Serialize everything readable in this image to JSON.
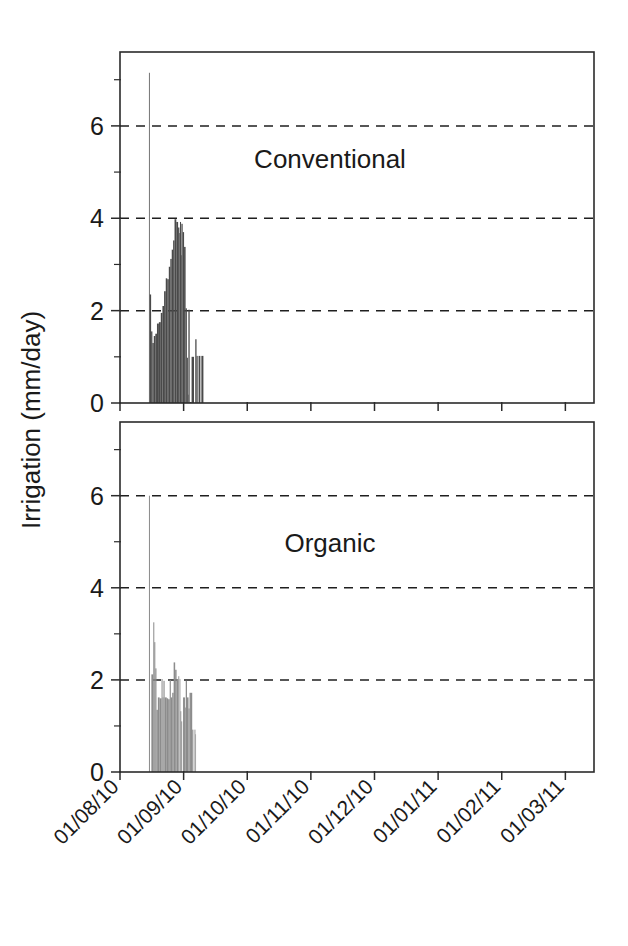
{
  "figure": {
    "ylabel": "Irrigation (mm/day)",
    "background": "#ffffff",
    "axis_color": "#2b2b2b"
  },
  "chart_data": {
    "type": "bar",
    "title": "",
    "xlabel": "",
    "ylabel": "Irrigation (mm/day)",
    "ylim": [
      0,
      7.6
    ],
    "yticks": [
      0,
      2,
      4,
      6
    ],
    "yticks_minor": [
      1,
      3,
      5,
      7
    ],
    "gridlines_y": [
      2,
      4,
      6
    ],
    "grid": "dashed horizontal only",
    "legend": "none",
    "xlim": [
      "01/08/10",
      "15/03/11"
    ],
    "xtick_labels": [
      "01/08/10",
      "01/09/10",
      "01/10/10",
      "01/11/10",
      "01/12/10",
      "01/01/11",
      "01/02/11",
      "01/03/11"
    ],
    "xtick_rotation": -45,
    "panels": [
      {
        "name": "Conventional",
        "annotation": "Conventional",
        "bar_color": "#4a4a4a",
        "series_name": "Conventional irrigation",
        "bars": [
          {
            "x": 0.455,
            "w": 0.012,
            "v": 7.15
          },
          {
            "x": 0.467,
            "w": 0.022,
            "v": 2.35
          },
          {
            "x": 0.489,
            "w": 0.02,
            "v": 1.55
          },
          {
            "x": 0.509,
            "w": 0.022,
            "v": 1.3
          },
          {
            "x": 0.531,
            "w": 0.024,
            "v": 1.45
          },
          {
            "x": 0.555,
            "w": 0.026,
            "v": 1.5
          },
          {
            "x": 0.581,
            "w": 0.03,
            "v": 1.72
          },
          {
            "x": 0.611,
            "w": 0.03,
            "v": 1.75
          },
          {
            "x": 0.641,
            "w": 0.026,
            "v": 1.95
          },
          {
            "x": 0.667,
            "w": 0.026,
            "v": 2.1
          },
          {
            "x": 0.693,
            "w": 0.026,
            "v": 2.42
          },
          {
            "x": 0.719,
            "w": 0.024,
            "v": 2.7
          },
          {
            "x": 0.743,
            "w": 0.024,
            "v": 2.68
          },
          {
            "x": 0.767,
            "w": 0.024,
            "v": 2.95
          },
          {
            "x": 0.791,
            "w": 0.022,
            "v": 3.12
          },
          {
            "x": 0.813,
            "w": 0.022,
            "v": 3.32
          },
          {
            "x": 0.835,
            "w": 0.022,
            "v": 3.52
          },
          {
            "x": 0.857,
            "w": 0.028,
            "v": 3.98
          },
          {
            "x": 0.885,
            "w": 0.028,
            "v": 3.92
          },
          {
            "x": 0.913,
            "w": 0.02,
            "v": 3.8
          },
          {
            "x": 0.933,
            "w": 0.01,
            "v": 3.68
          },
          {
            "x": 0.943,
            "w": 0.016,
            "v": 3.92
          },
          {
            "x": 0.959,
            "w": 0.006,
            "v": 3.2
          },
          {
            "x": 0.965,
            "w": 0.02,
            "v": 3.88
          },
          {
            "x": 0.985,
            "w": 0.022,
            "v": 3.7
          },
          {
            "x": 1.007,
            "w": 0.024,
            "v": 3.38
          },
          {
            "x": 1.031,
            "w": 0.02,
            "v": 2.05
          },
          {
            "x": 1.051,
            "w": 0.016,
            "v": 0.98
          },
          {
            "x": 1.067,
            "w": 0.008,
            "v": 0.18
          },
          {
            "x": 1.075,
            "w": 0.02,
            "v": 2.02
          },
          {
            "x": 1.095,
            "w": 0.03,
            "v": 0.02
          },
          {
            "x": 1.125,
            "w": 0.038,
            "v": 1.0
          },
          {
            "x": 1.163,
            "w": 0.02,
            "v": 0.0
          },
          {
            "x": 1.183,
            "w": 0.02,
            "v": 1.38
          },
          {
            "x": 1.203,
            "w": 0.018,
            "v": 1.02
          },
          {
            "x": 1.221,
            "w": 0.014,
            "v": 0.0
          },
          {
            "x": 1.235,
            "w": 0.028,
            "v": 1.02
          },
          {
            "x": 1.263,
            "w": 0.016,
            "v": 0.0
          },
          {
            "x": 1.279,
            "w": 0.032,
            "v": 1.02
          }
        ]
      },
      {
        "name": "Organic",
        "annotation": "Organic",
        "bar_color": "#8c8c8c",
        "series_name": "Organic irrigation",
        "bars": [
          {
            "x": 0.455,
            "w": 0.016,
            "v": 6.0
          },
          {
            "x": 0.471,
            "w": 0.022,
            "v": 0.0
          },
          {
            "x": 0.493,
            "w": 0.03,
            "v": 2.12
          },
          {
            "x": 0.523,
            "w": 0.016,
            "v": 3.25
          },
          {
            "x": 0.539,
            "w": 0.016,
            "v": 2.82
          },
          {
            "x": 0.555,
            "w": 0.018,
            "v": 2.25
          },
          {
            "x": 0.573,
            "w": 0.022,
            "v": 1.35
          },
          {
            "x": 0.595,
            "w": 0.028,
            "v": 1.62
          },
          {
            "x": 0.623,
            "w": 0.03,
            "v": 1.6
          },
          {
            "x": 0.653,
            "w": 0.016,
            "v": 2.02
          },
          {
            "x": 0.669,
            "w": 0.014,
            "v": 1.62
          },
          {
            "x": 0.683,
            "w": 0.018,
            "v": 1.98
          },
          {
            "x": 0.701,
            "w": 0.034,
            "v": 1.62
          },
          {
            "x": 0.735,
            "w": 0.022,
            "v": 1.6
          },
          {
            "x": 0.757,
            "w": 0.024,
            "v": 1.58
          },
          {
            "x": 0.781,
            "w": 0.018,
            "v": 2.0
          },
          {
            "x": 0.799,
            "w": 0.022,
            "v": 1.62
          },
          {
            "x": 0.821,
            "w": 0.022,
            "v": 1.72
          },
          {
            "x": 0.843,
            "w": 0.024,
            "v": 2.38
          },
          {
            "x": 0.867,
            "w": 0.022,
            "v": 2.22
          },
          {
            "x": 0.889,
            "w": 0.028,
            "v": 2.02
          },
          {
            "x": 0.917,
            "w": 0.014,
            "v": 2.08
          },
          {
            "x": 0.931,
            "w": 0.006,
            "v": 0.0
          },
          {
            "x": 0.937,
            "w": 0.012,
            "v": 2.02
          },
          {
            "x": 0.949,
            "w": 0.014,
            "v": 1.32
          },
          {
            "x": 0.963,
            "w": 0.014,
            "v": 1.1
          },
          {
            "x": 0.977,
            "w": 0.014,
            "v": 0.0
          },
          {
            "x": 0.991,
            "w": 0.03,
            "v": 1.62
          },
          {
            "x": 1.021,
            "w": 0.012,
            "v": 1.4
          },
          {
            "x": 1.033,
            "w": 0.02,
            "v": 1.98
          },
          {
            "x": 1.053,
            "w": 0.024,
            "v": 1.62
          },
          {
            "x": 1.077,
            "w": 0.016,
            "v": 1.38
          },
          {
            "x": 1.093,
            "w": 0.022,
            "v": 1.72
          },
          {
            "x": 1.115,
            "w": 0.02,
            "v": 1.72
          },
          {
            "x": 1.135,
            "w": 0.018,
            "v": 0.92
          },
          {
            "x": 1.153,
            "w": 0.018,
            "v": 0.0
          },
          {
            "x": 1.171,
            "w": 0.014,
            "v": 0.92
          },
          {
            "x": 1.185,
            "w": 0.01,
            "v": 0.82
          }
        ]
      }
    ]
  }
}
